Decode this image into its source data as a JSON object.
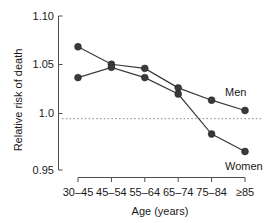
{
  "chart_data": {
    "type": "line",
    "title": "",
    "subtitle": "",
    "xlabel": "Age (years)",
    "ylabel": "Relative risk of death",
    "categories": [
      "30–45",
      "45–54",
      "55–64",
      "65–74",
      "75–84",
      "≥85"
    ],
    "ylim": [
      0.95,
      1.1
    ],
    "yticks": [
      0.95,
      1.0,
      1.05,
      1.1
    ],
    "ytick_labels": [
      "0.95",
      "1.0",
      "1.05",
      "1.10"
    ],
    "grid": false,
    "legend_position": "inline-end-of-line",
    "reference_line": {
      "value": 1.0,
      "style": "dotted",
      "color": "#8a8a8a"
    },
    "marker": {
      "shape": "circle",
      "color": "#3a3a3a",
      "size": 5
    },
    "series": [
      {
        "name": "Men",
        "values": [
          1.07,
          1.053,
          1.049,
          1.03,
          1.018,
          1.008
        ],
        "color": "#3a3a3a"
      },
      {
        "name": "Women",
        "values": [
          1.04,
          1.05,
          1.04,
          1.024,
          0.985,
          0.968
        ],
        "color": "#3a3a3a"
      }
    ],
    "annotations": [
      {
        "text": "Men",
        "series": "Men",
        "x_category": "≥85"
      },
      {
        "text": "Women",
        "series": "Women",
        "x_category": "≥85"
      }
    ]
  }
}
